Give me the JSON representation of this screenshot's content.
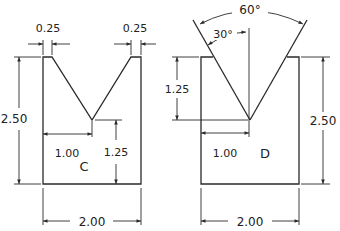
{
  "diagram": {
    "parts": [
      {
        "id": "C",
        "label": "C",
        "dims": {
          "ledge_left": "0.25",
          "ledge_right": "0.25",
          "height": "2.50",
          "v_depth_remaining": "1.25",
          "v_apex_offset": "1.00",
          "width": "2.00"
        }
      },
      {
        "id": "D",
        "label": "D",
        "dims": {
          "included_angle": "60°",
          "half_angle": "30°",
          "v_depth": "1.25",
          "height": "2.50",
          "v_apex_offset": "1.00",
          "width": "2.00"
        }
      }
    ],
    "colors": {
      "line": "#2a2a2a",
      "background": "#ffffff"
    }
  }
}
